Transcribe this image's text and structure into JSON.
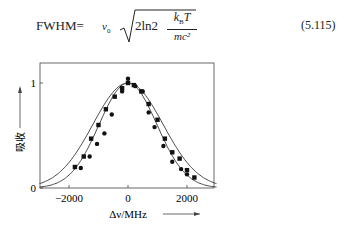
{
  "equation": {
    "lhs": "FWHM=",
    "nu": "ν",
    "nu_sub": "0",
    "radicand": "2ln2",
    "num": "k",
    "num_sub": "B",
    "num_tail": "T",
    "den": "mc²",
    "number": "(5.115)"
  },
  "chart_data": {
    "type": "line",
    "title": "",
    "xlabel": "Δν/MHz",
    "ylabel": "吸收",
    "xlim": [
      -3000,
      3000
    ],
    "ylim": [
      0,
      1.15
    ],
    "xticks": [
      -2000,
      0,
      2000
    ],
    "yticks": [
      0,
      1
    ],
    "grid": false,
    "legend": null,
    "series": [
      {
        "name": "wide-fit-curve",
        "kind": "gaussian-line",
        "center": 0,
        "fwhm_mhz": 2800
      },
      {
        "name": "narrow-fit-curve",
        "kind": "gaussian-line",
        "center": 0,
        "fwhm_mhz": 2300
      },
      {
        "name": "square-markers",
        "kind": "scatter",
        "marker": "square",
        "x": [
          -1800,
          -1500,
          -1250,
          -1000,
          -750,
          -450,
          -200,
          0,
          200,
          450,
          700,
          1000,
          1250,
          1500,
          1750,
          2000,
          2250
        ],
        "y": [
          0.2,
          0.3,
          0.47,
          0.6,
          0.75,
          0.87,
          0.95,
          1.0,
          0.98,
          0.92,
          0.8,
          0.65,
          0.47,
          0.34,
          0.28,
          0.17,
          0.1
        ]
      },
      {
        "name": "circle-markers",
        "kind": "scatter",
        "marker": "circle",
        "x": [
          -1600,
          -1300,
          -1050,
          -800,
          -550,
          -200,
          0,
          250,
          500,
          700,
          900,
          1200,
          1500,
          1800,
          2000
        ],
        "y": [
          0.19,
          0.3,
          0.42,
          0.52,
          0.7,
          0.92,
          1.04,
          0.97,
          0.92,
          0.72,
          0.58,
          0.4,
          0.25,
          0.18,
          0.13
        ]
      }
    ]
  }
}
